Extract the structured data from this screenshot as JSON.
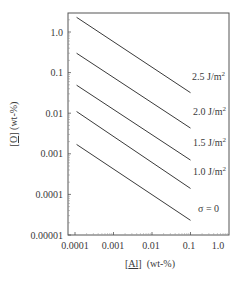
{
  "chart_data": {
    "type": "line",
    "title": "",
    "xlabel": "[Al] (wt-%)",
    "ylabel": "[O] (wt-%)",
    "xlabel_parts": {
      "element": "Al",
      "unit": "(wt-%)"
    },
    "ylabel_parts": {
      "element": "O",
      "unit": "(wt-%)"
    },
    "xscale": "log",
    "yscale": "log",
    "xlim": [
      0.0001,
      1.0
    ],
    "ylim": [
      1e-05,
      2.0
    ],
    "x_ticks": [
      "0.0001",
      "0.001",
      "0.01",
      "0.1",
      "1.0"
    ],
    "y_ticks": [
      "1.0",
      "0.1",
      "0.01",
      "0.001",
      "0.0001",
      "0.00001"
    ],
    "grid": false,
    "legend": "inline labels at right end of each line",
    "series": [
      {
        "name": "2.5 J/m2",
        "label_main": "2.5 J/m",
        "label_sup": "2",
        "x": [
          0.00011,
          0.1
        ],
        "y": [
          2.3,
          0.032
        ]
      },
      {
        "name": "2.0 J/m2",
        "label_main": "2.0 J/m",
        "label_sup": "2",
        "x": [
          0.00011,
          0.1
        ],
        "y": [
          0.3,
          0.0043
        ]
      },
      {
        "name": "1.5 J/m2",
        "label_main": "1.5 J/m",
        "label_sup": "2",
        "x": [
          0.00011,
          0.1
        ],
        "y": [
          0.049,
          0.0007
        ]
      },
      {
        "name": "1.0 J/m2",
        "label_main": "1.0 J/m",
        "label_sup": "2",
        "x": [
          0.00011,
          0.1
        ],
        "y": [
          0.011,
          0.00014
        ]
      },
      {
        "name": "σ = 0",
        "label_main": "σ = 0",
        "label_sup": "",
        "x": [
          0.00011,
          0.1
        ],
        "y": [
          0.0017,
          2.3e-05
        ]
      }
    ]
  },
  "style": {
    "line_color": "#3a3a3a",
    "frame_color": "#555555",
    "text_color": "#3a3a3a"
  }
}
